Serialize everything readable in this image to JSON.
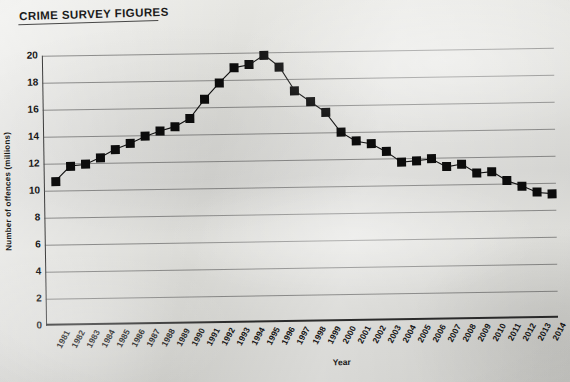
{
  "document": {
    "title": "CRIME SURVEY FIGURES",
    "medium": "photographed printed chart on paper"
  },
  "chart_data": {
    "type": "line",
    "title": "CRIME SURVEY FIGURES",
    "xlabel": "Year",
    "ylabel": "Number of offences (millions)",
    "ylim": [
      0,
      20
    ],
    "ytick_step": 2,
    "yticks": [
      "20",
      "18",
      "16",
      "14",
      "12",
      "10",
      "8",
      "6",
      "4",
      "2",
      "0"
    ],
    "grid": "horizontal",
    "legend": "none",
    "marker": "filled-square",
    "line_color": "#111111",
    "marker_color": "#0c0c0c",
    "categories": [
      "1981",
      "1982",
      "1983",
      "1984",
      "1985",
      "1986",
      "1987",
      "1988",
      "1989",
      "1990",
      "1991",
      "1992",
      "1993",
      "1994",
      "1995",
      "1996",
      "1997",
      "1998",
      "1999",
      "2000",
      "2001",
      "2002",
      "2003",
      "2004",
      "2005",
      "2006",
      "2007",
      "2008",
      "2009",
      "2010",
      "2011",
      "2012",
      "2013",
      "2014"
    ],
    "values": [
      10.7,
      11.8,
      11.9,
      12.4,
      13.0,
      13.4,
      13.9,
      14.3,
      14.6,
      15.2,
      16.6,
      17.8,
      18.9,
      19.1,
      19.8,
      18.9,
      17.1,
      16.3,
      15.5,
      14.0,
      13.3,
      13.1,
      12.5,
      11.7,
      11.8,
      11.9,
      11.3,
      11.5,
      10.8,
      10.9,
      10.2,
      9.8,
      9.3,
      9.2
    ]
  }
}
